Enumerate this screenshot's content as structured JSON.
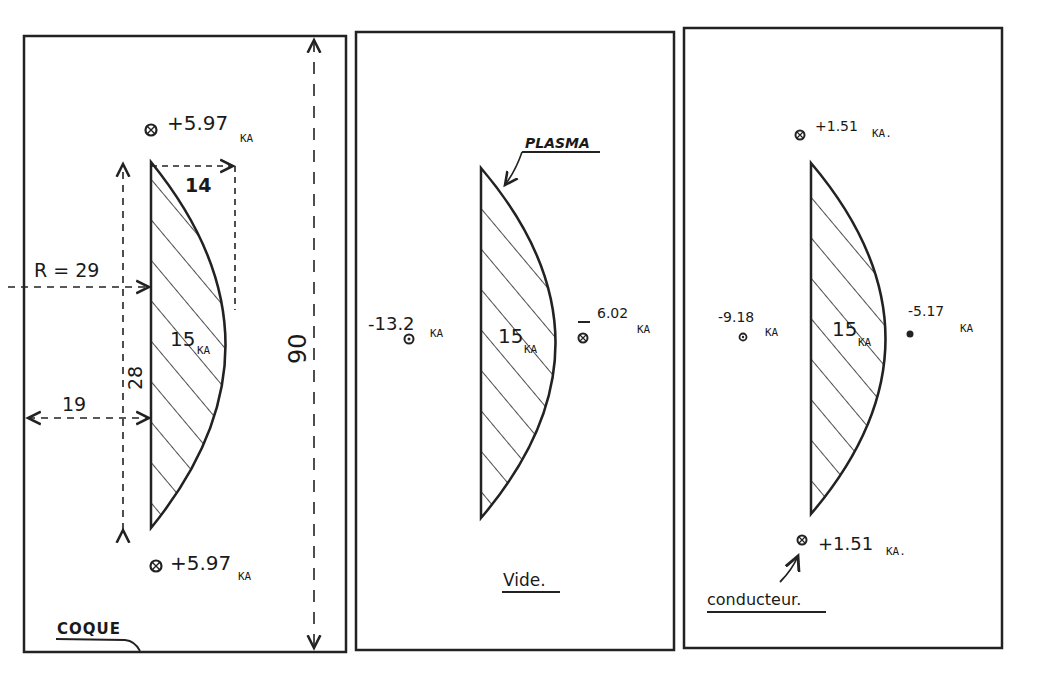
{
  "panels": [
    {
      "id": "coque",
      "caption": "COQUE",
      "plasma_current": "15",
      "plasma_unit": "KA",
      "conductors": [
        {
          "position": "top",
          "value": "+5.97",
          "unit": "KA"
        },
        {
          "position": "bottom",
          "value": "+5.97",
          "unit": "KA"
        }
      ],
      "dimensions": {
        "radius": "R = 29",
        "width": "14",
        "height": "28",
        "offset": "19",
        "total_height": "90"
      }
    },
    {
      "id": "vide",
      "caption": "Vide.",
      "plasma_label": "PLASMA",
      "plasma_current": "15",
      "plasma_unit": "KA",
      "conductors": [
        {
          "position": "left",
          "value": "-13.2",
          "unit": "KA"
        },
        {
          "position": "right",
          "value": "-6.02",
          "unit": "KA"
        }
      ]
    },
    {
      "id": "conducteur",
      "caption": "conducteur.",
      "plasma_current": "15",
      "plasma_unit": "KA",
      "conductors": [
        {
          "position": "top",
          "value": "+1.51",
          "unit": "KA."
        },
        {
          "position": "left",
          "value": "-9.18",
          "unit": "KA"
        },
        {
          "position": "right",
          "value": "-5.17",
          "unit": "KA"
        },
        {
          "position": "bottom",
          "value": "+1.51",
          "unit": "KA."
        }
      ]
    }
  ]
}
